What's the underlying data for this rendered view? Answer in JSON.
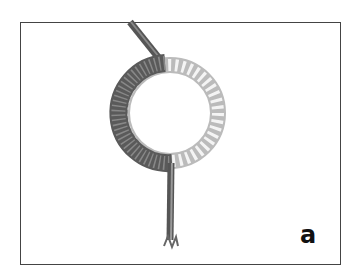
{
  "figure": {
    "label": "a",
    "colors": {
      "frame": "#444444",
      "cord": "#555555",
      "ring_metal": "#cfcfcf",
      "background": "#ffffff"
    }
  }
}
